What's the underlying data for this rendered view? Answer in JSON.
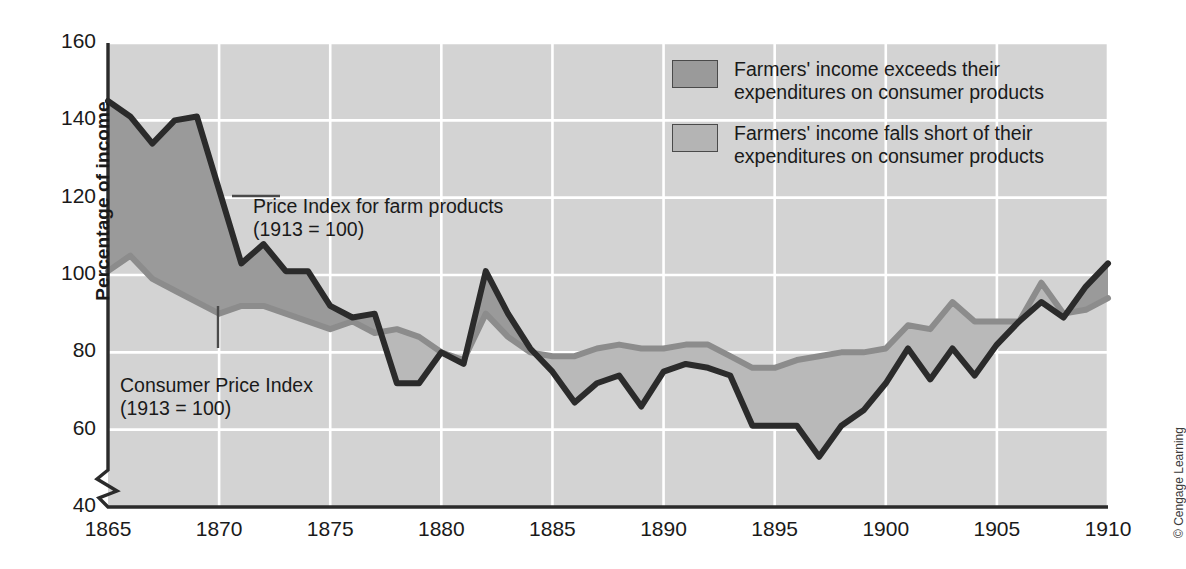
{
  "axes": {
    "ylabel": "Percentage of income",
    "yticks": [
      40,
      60,
      80,
      100,
      120,
      140,
      160
    ],
    "xticks": [
      1865,
      1870,
      1875,
      1880,
      1885,
      1890,
      1895,
      1900,
      1905,
      1910
    ]
  },
  "legend": [
    {
      "label": "Farmers' income exceeds their\nexpenditures on consumer products",
      "color": "#9a9a9a"
    },
    {
      "label": "Farmers' income falls short of their\nexpenditures on consumer products",
      "color": "#b4b4b4"
    }
  ],
  "annotations": [
    {
      "name": "farm-price-index",
      "text": "Price Index for farm products\n(1913 = 100)"
    },
    {
      "name": "consumer-price-index",
      "text": "Consumer Price Index\n(1913 = 100)"
    }
  ],
  "credit": "© Cengage Learning",
  "colors": {
    "plot_background": "#d3d3d3",
    "grid": "#ffffff",
    "farm_line": "#2b2b2b",
    "cpi_line": "#8c8c8c",
    "band_above": "#9a9a9a",
    "band_below": "#b9b9b9",
    "axis": "#2b2b2b"
  },
  "chart_data": {
    "type": "line",
    "title": "",
    "xlabel": "",
    "ylabel": "Percentage of income",
    "xlim": [
      1865,
      1910
    ],
    "ylim": [
      40,
      160
    ],
    "y_axis_break_below": 40,
    "grid": true,
    "legend_position": "top-right",
    "x": [
      1865,
      1866,
      1867,
      1868,
      1869,
      1870,
      1871,
      1872,
      1873,
      1874,
      1875,
      1876,
      1877,
      1878,
      1879,
      1880,
      1881,
      1882,
      1883,
      1884,
      1885,
      1886,
      1887,
      1888,
      1889,
      1890,
      1891,
      1892,
      1893,
      1894,
      1895,
      1896,
      1897,
      1898,
      1899,
      1900,
      1901,
      1902,
      1903,
      1904,
      1905,
      1906,
      1907,
      1908,
      1909,
      1910
    ],
    "series": [
      {
        "name": "Price Index for farm products (1913 = 100)",
        "color": "#2b2b2b",
        "values": [
          145,
          141,
          134,
          140,
          141,
          122,
          103,
          108,
          101,
          101,
          92,
          89,
          90,
          72,
          72,
          80,
          77,
          101,
          90,
          81,
          75,
          67,
          72,
          74,
          66,
          75,
          77,
          76,
          74,
          61,
          61,
          61,
          53,
          61,
          65,
          72,
          81,
          73,
          81,
          74,
          82,
          88,
          93,
          89,
          97,
          103
        ]
      },
      {
        "name": "Consumer Price Index (1913 = 100)",
        "color": "#8c8c8c",
        "values": [
          101,
          105,
          99,
          96,
          93,
          90,
          92,
          92,
          90,
          88,
          86,
          88,
          85,
          86,
          84,
          80,
          78,
          90,
          84,
          80,
          79,
          79,
          81,
          82,
          81,
          81,
          82,
          82,
          79,
          76,
          76,
          78,
          79,
          80,
          80,
          81,
          87,
          86,
          93,
          88,
          88,
          88,
          98,
          90,
          91,
          94
        ]
      }
    ]
  }
}
